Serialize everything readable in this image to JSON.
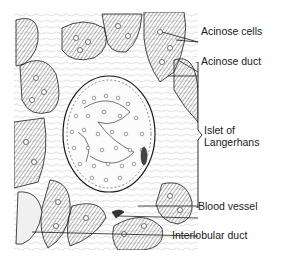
{
  "diagram": {
    "labels": {
      "acinose_cells": "Acinose cells",
      "acinose_duct": "Acinose duct",
      "islet_line1": "Islet of",
      "islet_line2": "Langerhans",
      "blood_vessel": "Blood vessel",
      "interlobular_duct": "Interlobular duct"
    },
    "colors": {
      "ink": "#1a1a1a",
      "tissue_shade": "#8a8a8a",
      "background": "#ffffff"
    }
  }
}
